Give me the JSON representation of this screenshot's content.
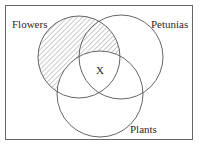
{
  "diagram": {
    "type": "venn",
    "sets": [
      {
        "id": "flowers",
        "label": "Flowers",
        "shaded_region": "Flowers minus Plants"
      },
      {
        "id": "petunias",
        "label": "Petunias"
      },
      {
        "id": "plants",
        "label": "Plants"
      }
    ],
    "marker": {
      "label": "X",
      "region": "Flowers ∩ Petunias ∩ Plants"
    },
    "colors": {
      "stroke": "#555555",
      "hatch": "#777777",
      "background": "#ffffff"
    }
  }
}
